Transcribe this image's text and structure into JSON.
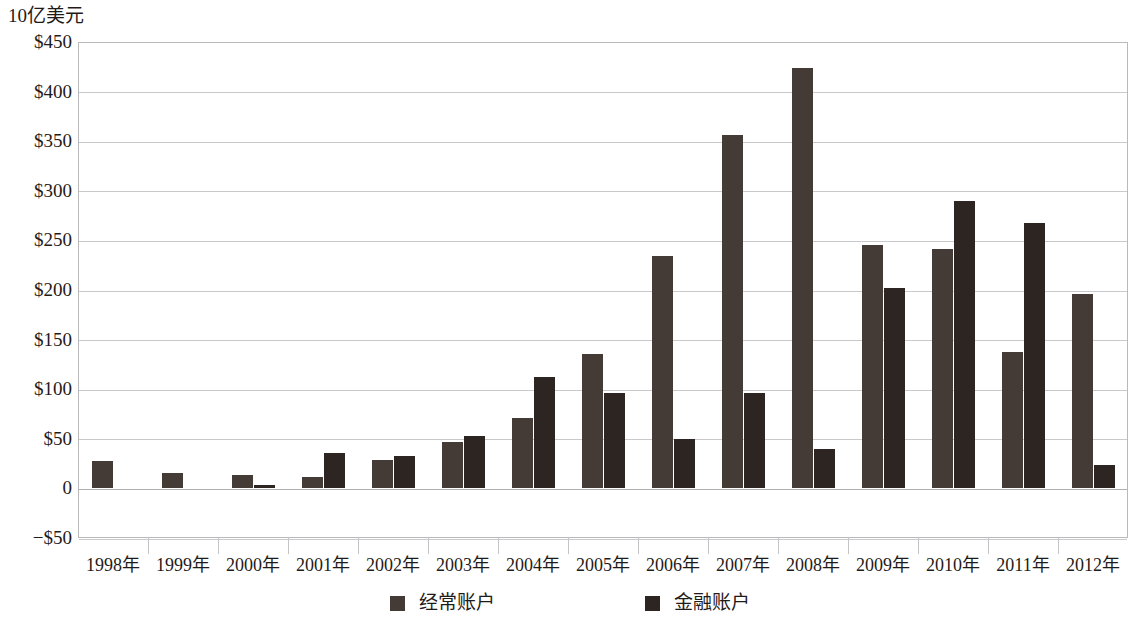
{
  "chart_data": {
    "type": "bar",
    "title": "",
    "subtitle": "",
    "unit_caption": "10亿美元",
    "xlabel": "",
    "ylabel": "",
    "ylim": [
      -50,
      450
    ],
    "ytick_step": 50,
    "ytick_labels": [
      "$450",
      "$400",
      "$350",
      "$300",
      "$250",
      "$200",
      "$150",
      "$100",
      "$50",
      "0",
      "−$50"
    ],
    "ytick_values": [
      450,
      400,
      350,
      300,
      250,
      200,
      150,
      100,
      50,
      0,
      -50
    ],
    "grid": true,
    "legend_position": "bottom",
    "categories": [
      "1998年",
      "1999年",
      "2000年",
      "2001年",
      "2002年",
      "2003年",
      "2004年",
      "2005年",
      "2006年",
      "2007年",
      "2008年",
      "2009年",
      "2010年",
      "2011年",
      "2012年"
    ],
    "series": [
      {
        "name": "经常账户",
        "color": "#443b37",
        "values": [
          28,
          16,
          14,
          11,
          29,
          47,
          71,
          135,
          234,
          356,
          424,
          245,
          241,
          138,
          196
        ]
      },
      {
        "name": "金融账户",
        "color": "#2c2522",
        "values": [
          0,
          0,
          3,
          36,
          33,
          53,
          112,
          96,
          50,
          96,
          40,
          202,
          290,
          268,
          24
        ]
      }
    ]
  },
  "legend": {
    "entries": [
      {
        "label": "经常账户",
        "swatch": "current"
      },
      {
        "label": "金融账户",
        "swatch": "financial"
      }
    ]
  }
}
